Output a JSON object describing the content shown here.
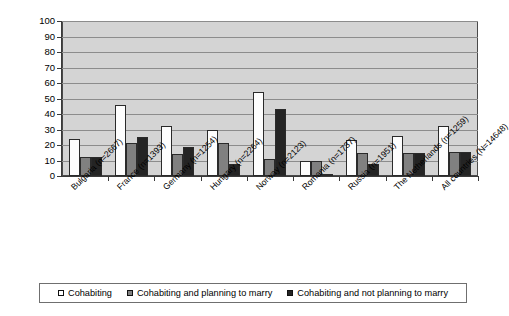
{
  "chart_data": {
    "type": "bar",
    "title": "",
    "xlabel": "",
    "ylabel": "",
    "ylim": [
      0,
      100
    ],
    "ytick_step": 10,
    "grid": true,
    "legend_position": "bottom",
    "plot_background": "#d4d4d4",
    "categories": [
      "Bulgaria (n=2667)",
      "France (n=1393)",
      "Germany (n=1254)",
      "Hungary (n=2264)",
      "Norway (n=2123)",
      "Romania (n=1737)",
      "Russia (n=1951)",
      "The Netherlands (n=1259)",
      "All countries (N=14648)"
    ],
    "yticks": [
      "0",
      "10",
      "20",
      "30",
      "40",
      "50",
      "60",
      "70",
      "80",
      "90",
      "100"
    ],
    "series": [
      {
        "name": "Cohabiting",
        "color": "#ffffff",
        "values": [
          24,
          46,
          32.5,
          30,
          54,
          10,
          23.5,
          26,
          32
        ]
      },
      {
        "name": "Cohabiting and planning to marry",
        "color": "#808080",
        "values": [
          12,
          21,
          14,
          21.5,
          11,
          9.5,
          15,
          15,
          15.5
        ]
      },
      {
        "name": "Cohabiting and not planning to marry",
        "color": "#242424",
        "values": [
          12,
          25,
          18.5,
          8,
          43,
          1,
          8,
          15,
          15.5
        ]
      }
    ]
  }
}
